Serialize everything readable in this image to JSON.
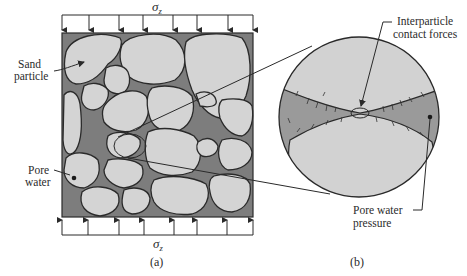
{
  "figure": {
    "panel_a": {
      "caption": "(a)",
      "top_load": {
        "symbol": "σ",
        "subscript": "z"
      },
      "bottom_load": {
        "symbol": "σ",
        "subscript": "z"
      },
      "labels": {
        "sand_particle_line1": "Sand",
        "sand_particle_line2": "particle",
        "pore_water_line1": "Pore",
        "pore_water_line2": "water"
      }
    },
    "panel_b": {
      "caption": "(b)",
      "labels": {
        "contact_forces_line1": "Interparticle",
        "contact_forces_line2": "contact forces",
        "pore_pressure_line1": "Pore water",
        "pore_pressure_line2": "pressure"
      }
    },
    "colors": {
      "pore_water": "#7d7d7d",
      "grain": "#d4d4d4",
      "pore_water_zoom": "#9a9a9a",
      "outline": "#2a2a2a"
    }
  }
}
